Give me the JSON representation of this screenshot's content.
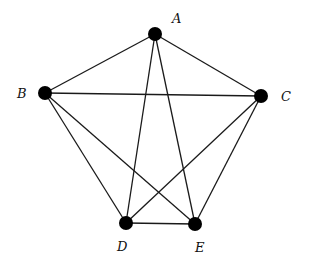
{
  "diagram": {
    "type": "graph",
    "name": "complete-graph-K5",
    "node_color": "#000000",
    "edge_color": "#1a1a1a",
    "nodes": [
      {
        "id": "A",
        "label": "A",
        "x": 155,
        "y": 34,
        "lx": 172,
        "ly": 23
      },
      {
        "id": "B",
        "label": "B",
        "x": 45,
        "y": 93,
        "lx": 17,
        "ly": 98
      },
      {
        "id": "C",
        "label": "C",
        "x": 261,
        "y": 96,
        "lx": 281,
        "ly": 101
      },
      {
        "id": "D",
        "label": "D",
        "x": 126,
        "y": 223,
        "lx": 117,
        "ly": 251
      },
      {
        "id": "E",
        "label": "E",
        "x": 195,
        "y": 224,
        "lx": 195,
        "ly": 252
      }
    ],
    "edges": [
      [
        "A",
        "B"
      ],
      [
        "A",
        "C"
      ],
      [
        "A",
        "D"
      ],
      [
        "A",
        "E"
      ],
      [
        "B",
        "C"
      ],
      [
        "B",
        "D"
      ],
      [
        "B",
        "E"
      ],
      [
        "C",
        "D"
      ],
      [
        "C",
        "E"
      ],
      [
        "D",
        "E"
      ]
    ]
  }
}
